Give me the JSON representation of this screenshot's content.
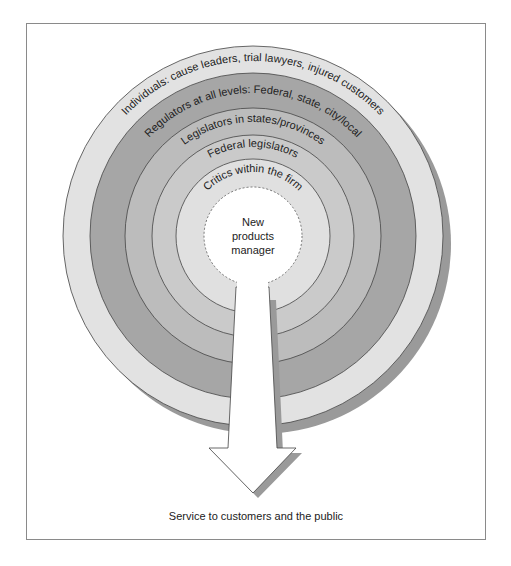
{
  "diagram": {
    "type": "concentric-rings-with-arrow",
    "center_label": [
      "New",
      "products",
      "manager"
    ],
    "rings": [
      {
        "label": "Individuals:  cause leaders, trial lawyers, injured customers",
        "radius": 190,
        "color": "#e2e2e2"
      },
      {
        "label": "Regulators at all levels:  Federal, state, city/local",
        "radius": 163,
        "color": "#a6a6a6"
      },
      {
        "label": "Legislators in states/provinces",
        "radius": 128,
        "color": "#bcbcbc"
      },
      {
        "label": "Federal legislators",
        "radius": 101,
        "color": "#cacaca"
      },
      {
        "label": "Critics within the firm",
        "radius": 77,
        "color": "#e0e0e0"
      }
    ],
    "center_radius": 49,
    "shadow_color": "#9a9a9a",
    "arrow_caption": "Service to customers and the public"
  }
}
